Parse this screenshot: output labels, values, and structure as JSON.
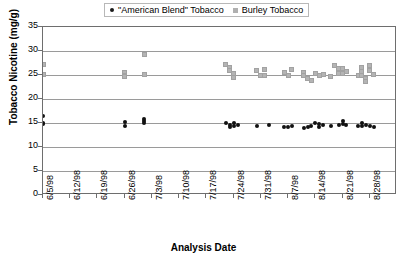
{
  "chart_data": {
    "type": "scatter",
    "title": "",
    "xlabel": "Analysis Date",
    "ylabel": "Tobacco Nicotine (mg/g)",
    "ylim": [
      0,
      35
    ],
    "ytick_values": [
      0,
      5,
      10,
      15,
      20,
      25,
      30,
      35
    ],
    "ytick_labels": [
      "0",
      "5",
      "10",
      "15",
      "20",
      "25",
      "30",
      "35"
    ],
    "grid": true,
    "grid_axis": "y",
    "legend_position": "top-center",
    "xlim": [
      "6/5/98",
      "9/4/98"
    ],
    "xtick_labels": [
      "6/5/98",
      "6/12/98",
      "6/19/98",
      "6/26/98",
      "7/3/98",
      "7/10/98",
      "7/17/98",
      "7/24/98",
      "7/31/98",
      "8/7/98",
      "8/14/98",
      "8/21/98",
      "8/28/98"
    ],
    "series": [
      {
        "name": "\"American Blend\" Tobacco",
        "marker": "circle",
        "color": "#111111",
        "points": [
          {
            "x": "6/5/98",
            "y": 16.4
          },
          {
            "x": "6/5/98",
            "y": 15.0
          },
          {
            "x": "6/5/98",
            "y": 14.7
          },
          {
            "x": "6/26/98",
            "y": 15.3
          },
          {
            "x": "6/26/98",
            "y": 14.3
          },
          {
            "x": "7/1/98",
            "y": 15.9
          },
          {
            "x": "7/1/98",
            "y": 15.4
          },
          {
            "x": "7/1/98",
            "y": 15.0
          },
          {
            "x": "7/22/98",
            "y": 14.9
          },
          {
            "x": "7/23/98",
            "y": 14.6
          },
          {
            "x": "7/23/98",
            "y": 14.2
          },
          {
            "x": "7/24/98",
            "y": 15.1
          },
          {
            "x": "7/24/98",
            "y": 14.4
          },
          {
            "x": "7/25/98",
            "y": 14.6
          },
          {
            "x": "7/30/98",
            "y": 14.4
          },
          {
            "x": "8/2/98",
            "y": 14.5
          },
          {
            "x": "8/6/98",
            "y": 14.2
          },
          {
            "x": "8/7/98",
            "y": 14.1
          },
          {
            "x": "8/8/98",
            "y": 14.3
          },
          {
            "x": "8/11/98",
            "y": 14.0
          },
          {
            "x": "8/12/98",
            "y": 14.2
          },
          {
            "x": "8/13/98",
            "y": 14.4
          },
          {
            "x": "8/14/98",
            "y": 14.9
          },
          {
            "x": "8/15/98",
            "y": 14.7
          },
          {
            "x": "8/15/98",
            "y": 14.2
          },
          {
            "x": "8/16/98",
            "y": 14.6
          },
          {
            "x": "8/18/98",
            "y": 14.3
          },
          {
            "x": "8/20/98",
            "y": 14.5
          },
          {
            "x": "8/21/98",
            "y": 15.4
          },
          {
            "x": "8/21/98",
            "y": 14.8
          },
          {
            "x": "8/22/98",
            "y": 14.6
          },
          {
            "x": "8/25/98",
            "y": 14.4
          },
          {
            "x": "8/26/98",
            "y": 14.9
          },
          {
            "x": "8/26/98",
            "y": 14.3
          },
          {
            "x": "8/27/98",
            "y": 14.5
          },
          {
            "x": "8/28/98",
            "y": 14.4
          },
          {
            "x": "8/29/98",
            "y": 14.2
          }
        ]
      },
      {
        "name": "Burley Tobacco",
        "marker": "square",
        "color": "#b4b4b4",
        "points": [
          {
            "x": "6/5/98",
            "y": 27.2
          },
          {
            "x": "6/5/98",
            "y": 25.2
          },
          {
            "x": "6/26/98",
            "y": 25.6
          },
          {
            "x": "6/26/98",
            "y": 25.0
          },
          {
            "x": "6/26/98",
            "y": 24.6
          },
          {
            "x": "7/1/98",
            "y": 29.3
          },
          {
            "x": "7/1/98",
            "y": 25.1
          },
          {
            "x": "7/22/98",
            "y": 27.2
          },
          {
            "x": "7/23/98",
            "y": 26.5
          },
          {
            "x": "7/23/98",
            "y": 25.9
          },
          {
            "x": "7/24/98",
            "y": 25.3
          },
          {
            "x": "7/24/98",
            "y": 24.5
          },
          {
            "x": "7/30/98",
            "y": 26.0
          },
          {
            "x": "7/31/98",
            "y": 25.0
          },
          {
            "x": "8/1/98",
            "y": 26.1
          },
          {
            "x": "8/1/98",
            "y": 25.0
          },
          {
            "x": "8/6/98",
            "y": 25.6
          },
          {
            "x": "8/7/98",
            "y": 24.9
          },
          {
            "x": "8/8/98",
            "y": 26.2
          },
          {
            "x": "8/11/98",
            "y": 25.5
          },
          {
            "x": "8/11/98",
            "y": 24.8
          },
          {
            "x": "8/12/98",
            "y": 24.2
          },
          {
            "x": "8/13/98",
            "y": 23.8
          },
          {
            "x": "8/14/98",
            "y": 25.4
          },
          {
            "x": "8/15/98",
            "y": 24.9
          },
          {
            "x": "8/16/98",
            "y": 25.2
          },
          {
            "x": "8/18/98",
            "y": 24.7
          },
          {
            "x": "8/19/98",
            "y": 27.0
          },
          {
            "x": "8/20/98",
            "y": 26.3
          },
          {
            "x": "8/20/98",
            "y": 25.4
          },
          {
            "x": "8/21/98",
            "y": 26.4
          },
          {
            "x": "8/21/98",
            "y": 25.3
          },
          {
            "x": "8/22/98",
            "y": 25.7
          },
          {
            "x": "8/25/98",
            "y": 25.0
          },
          {
            "x": "8/26/98",
            "y": 26.6
          },
          {
            "x": "8/26/98",
            "y": 25.8
          },
          {
            "x": "8/26/98",
            "y": 24.9
          },
          {
            "x": "8/27/98",
            "y": 24.3
          },
          {
            "x": "8/27/98",
            "y": 23.6
          },
          {
            "x": "8/28/98",
            "y": 26.9
          },
          {
            "x": "8/28/98",
            "y": 25.9
          },
          {
            "x": "8/29/98",
            "y": 25.1
          }
        ]
      }
    ]
  },
  "legend": {
    "entries": [
      {
        "label": "\"American Blend\" Tobacco",
        "marker": "dot"
      },
      {
        "label": "Burley Tobacco",
        "marker": "square"
      }
    ]
  },
  "axes": {
    "y_title": "Tobacco Nicotine (mg/g)",
    "x_title": "Analysis Date"
  },
  "colors": {
    "american_blend": "#111111",
    "burley": "#b4b4b4",
    "grid": "#9a9a9a",
    "frame": "#6e6e6e"
  }
}
